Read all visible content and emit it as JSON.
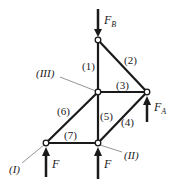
{
  "diagram": {
    "type": "truss",
    "nodes": [
      {
        "id": "top",
        "x": 98,
        "y": 40
      },
      {
        "id": "III",
        "x": 98,
        "y": 92,
        "label": "(III)"
      },
      {
        "id": "A",
        "x": 147,
        "y": 92
      },
      {
        "id": "I",
        "x": 46,
        "y": 143,
        "label": "(I)"
      },
      {
        "id": "II",
        "x": 98,
        "y": 143,
        "label": "(II)"
      }
    ],
    "members": [
      {
        "label": "(1)",
        "from": "top",
        "to": "III"
      },
      {
        "label": "(2)",
        "from": "top",
        "to": "A"
      },
      {
        "label": "(3)",
        "from": "III",
        "to": "A"
      },
      {
        "label": "(4)",
        "from": "II",
        "to": "A"
      },
      {
        "label": "(5)",
        "from": "III",
        "to": "II"
      },
      {
        "label": "(6)",
        "from": "I",
        "to": "III"
      },
      {
        "label": "(7)",
        "from": "I",
        "to": "II"
      }
    ],
    "forces": [
      {
        "name": "F",
        "sub": "B",
        "at": "top",
        "direction": "down"
      },
      {
        "name": "F",
        "sub": "A",
        "at": "A",
        "direction": "up"
      },
      {
        "name": "F",
        "sub": "",
        "at": "I",
        "direction": "up"
      },
      {
        "name": "F",
        "sub": "",
        "at": "II",
        "direction": "up"
      }
    ],
    "text": {
      "m1": "(1)",
      "m2": "(2)",
      "m3": "(3)",
      "m4": "(4)",
      "m5": "(5)",
      "m6": "(6)",
      "m7": "(7)",
      "nI": "(I)",
      "nII": "(II)",
      "nIII": "(III)",
      "fb": "F",
      "fb_sub": "B",
      "fa": "F",
      "fa_sub": "A",
      "f1": "F",
      "f2": "F"
    }
  }
}
